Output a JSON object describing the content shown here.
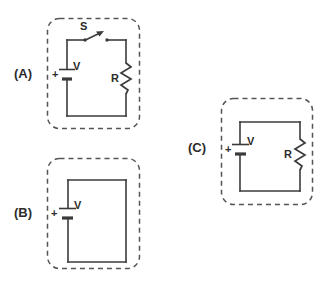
{
  "figure": {
    "background_color": "#ffffff",
    "line_color": "#3b3b3b",
    "dash_color": "#555555"
  },
  "options": [
    {
      "id": "A",
      "label": "(A)",
      "description": "Closed loop with battery, open switch and resistor",
      "components": {
        "switch_label": "S",
        "battery_label": "V",
        "battery_polarity": "+",
        "resistor_label": "R"
      }
    },
    {
      "id": "B",
      "label": "(B)",
      "description": "Closed loop with battery only, no resistor or switch",
      "components": {
        "battery_label": "V",
        "battery_polarity": "+"
      }
    },
    {
      "id": "C",
      "label": "(C)",
      "description": "Closed loop with battery and resistor, no switch",
      "components": {
        "battery_label": "V",
        "battery_polarity": "+",
        "resistor_label": "R"
      }
    }
  ]
}
